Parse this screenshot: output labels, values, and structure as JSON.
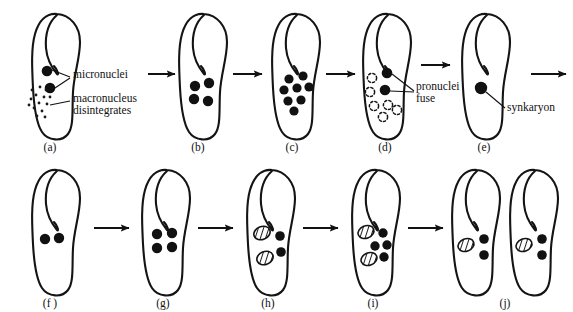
{
  "figure": {
    "background_color": "#ffffff",
    "ink_color": "#111111",
    "width": 573,
    "height": 312
  },
  "annotations": [
    {
      "id": "micronuclei",
      "text": "micronuclei"
    },
    {
      "id": "macronucleus",
      "text": "macronucleus"
    },
    {
      "id": "disintegrates",
      "text": "disintegrates"
    },
    {
      "id": "pronuclei",
      "text": "pronuclei"
    },
    {
      "id": "fuse",
      "text": "fuse"
    },
    {
      "id": "synkaryon",
      "text": "synkaryon"
    }
  ],
  "stages": [
    {
      "id": "a",
      "caption": "(a)",
      "micronuclei_count": 2,
      "macronucleus_state": "disintegrating",
      "macronucleus_dots": 14,
      "degenerating_count": 0,
      "macronuclei_hatched": 0
    },
    {
      "id": "b",
      "caption": "(b)",
      "micronuclei_count": 4,
      "macronucleus_state": "absent",
      "macronucleus_dots": 0,
      "degenerating_count": 0,
      "macronuclei_hatched": 0
    },
    {
      "id": "c",
      "caption": "(c)",
      "micronuclei_count": 8,
      "macronucleus_state": "absent",
      "macronucleus_dots": 0,
      "degenerating_count": 0,
      "macronuclei_hatched": 0
    },
    {
      "id": "d",
      "caption": "(d)",
      "micronuclei_count": 2,
      "macronucleus_state": "absent",
      "macronucleus_dots": 0,
      "degenerating_count": 6,
      "macronuclei_hatched": 0
    },
    {
      "id": "e",
      "caption": "(e)",
      "micronuclei_count": 1,
      "macronucleus_state": "absent",
      "macronucleus_dots": 0,
      "degenerating_count": 0,
      "macronuclei_hatched": 0
    },
    {
      "id": "f",
      "caption": "(f )",
      "micronuclei_count": 2,
      "macronucleus_state": "absent",
      "macronucleus_dots": 0,
      "degenerating_count": 0,
      "macronuclei_hatched": 0
    },
    {
      "id": "g",
      "caption": "(g)",
      "micronuclei_count": 4,
      "macronucleus_state": "absent",
      "macronucleus_dots": 0,
      "degenerating_count": 0,
      "macronuclei_hatched": 0
    },
    {
      "id": "h",
      "caption": "(h)",
      "micronuclei_count": 2,
      "macronucleus_state": "absent",
      "macronucleus_dots": 0,
      "degenerating_count": 0,
      "macronuclei_hatched": 2
    },
    {
      "id": "i",
      "caption": "(i)",
      "micronuclei_count": 4,
      "macronucleus_state": "absent",
      "macronucleus_dots": 0,
      "degenerating_count": 0,
      "macronuclei_hatched": 2
    },
    {
      "id": "j",
      "caption": "(j)",
      "micronuclei_count": 2,
      "macronucleus_state": "absent",
      "macronucleus_dots": 0,
      "degenerating_count": 0,
      "macronuclei_hatched": 1,
      "daughter_cells": 2
    }
  ],
  "arrows": {
    "row1_count": 5,
    "row2_count": 4,
    "direction": "right"
  }
}
